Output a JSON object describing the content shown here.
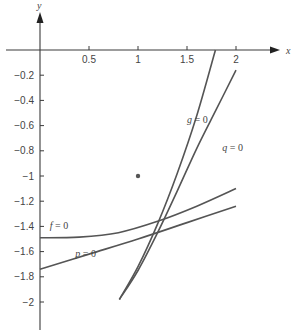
{
  "chart_data": {
    "type": "line",
    "title": "",
    "xlabel": "x",
    "ylabel": "y",
    "xlim": [
      -0.4,
      2.2
    ],
    "ylim": [
      -2.3,
      0.35
    ],
    "grid": false,
    "x_ticks": [
      0.5,
      1,
      1.5,
      2
    ],
    "x_tick_labels": [
      "0.5",
      "1",
      "1.5",
      "2"
    ],
    "y_ticks": [
      -0.2,
      -0.4,
      -0.6,
      -0.8,
      -1,
      -1.2,
      -1.4,
      -1.6,
      -1.8,
      -2
    ],
    "y_tick_labels": [
      "-0.2",
      "-0.4",
      "-0.6",
      "-0.8",
      "-1",
      "-1.2",
      "-1.4",
      "-1.6",
      "-1.8",
      "-2"
    ],
    "series": [
      {
        "name": "f = 0",
        "var": "f",
        "points": [
          [
            0,
            -1.49
          ],
          [
            0.4,
            -1.485
          ],
          [
            0.8,
            -1.45
          ],
          [
            1.2,
            -1.36
          ],
          [
            1.6,
            -1.24
          ],
          [
            2.0,
            -1.1
          ]
        ],
        "label_at": [
          0.1,
          -1.42
        ]
      },
      {
        "name": "p = 0",
        "var": "p",
        "points": [
          [
            0,
            -1.74
          ],
          [
            0.5,
            -1.62
          ],
          [
            1.0,
            -1.5
          ],
          [
            1.5,
            -1.37
          ],
          [
            2.0,
            -1.24
          ]
        ],
        "label_at": [
          0.36,
          -1.64
        ]
      },
      {
        "name": "g = 0",
        "var": "g",
        "points": [
          [
            0.81,
            -1.98
          ],
          [
            1.0,
            -1.72
          ],
          [
            1.2,
            -1.38
          ],
          [
            1.4,
            -0.98
          ],
          [
            1.6,
            -0.52
          ],
          [
            1.79,
            0
          ]
        ],
        "label_at": [
          1.5,
          -0.58
        ]
      },
      {
        "name": "q = 0",
        "var": "q",
        "points": [
          [
            0.81,
            -1.98
          ],
          [
            1.0,
            -1.75
          ],
          [
            1.2,
            -1.45
          ],
          [
            1.4,
            -1.12
          ],
          [
            1.6,
            -0.78
          ],
          [
            1.8,
            -0.47
          ],
          [
            2.0,
            -0.16
          ]
        ],
        "label_at": [
          1.86,
          -0.8
        ]
      }
    ],
    "points": [
      {
        "name": "marked-point",
        "x": 1,
        "y": -1
      }
    ]
  }
}
